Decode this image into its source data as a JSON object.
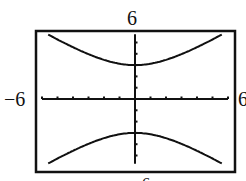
{
  "chart_data": {
    "type": "line",
    "title": "",
    "xlabel": "",
    "ylabel": "",
    "xlim": [
      -6,
      6
    ],
    "ylim": [
      -6,
      6
    ],
    "window_labels": {
      "top": "6",
      "left": "−6",
      "right": "6",
      "bottom": "−6"
    },
    "ticks": {
      "x_step": 1,
      "y_step": 1
    },
    "grid": false,
    "series": [
      {
        "name": "upper branch",
        "x": [
          -5.6,
          -5,
          -4,
          -3,
          -2,
          -1,
          0,
          1,
          2,
          3,
          4,
          5,
          5.6
        ],
        "y": [
          5.69,
          5.27,
          4.58,
          3.97,
          3.46,
          3.12,
          3.0,
          3.12,
          3.46,
          3.97,
          4.58,
          5.27,
          5.69
        ]
      },
      {
        "name": "lower branch",
        "x": [
          -5.6,
          -5,
          -4,
          -3,
          -2,
          -1,
          0,
          1,
          2,
          3,
          4,
          5,
          5.6
        ],
        "y": [
          -5.69,
          -5.27,
          -4.58,
          -3.97,
          -3.46,
          -3.12,
          -3.0,
          -3.12,
          -3.46,
          -3.97,
          -4.58,
          -5.27,
          -5.69
        ]
      }
    ]
  }
}
